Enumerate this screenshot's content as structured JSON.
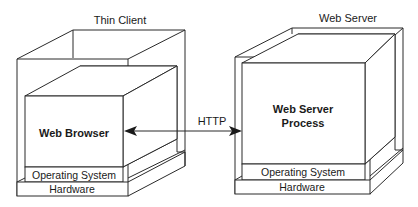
{
  "diagram": {
    "left_node": {
      "title": "Thin Client",
      "inner_label": "Web Browser",
      "os_label": "Operating System",
      "hardware_label": "Hardware"
    },
    "right_node": {
      "title": "Web Server",
      "inner_label_line1": "Web Server",
      "inner_label_line2": "Process",
      "os_label": "Operating System",
      "hardware_label": "Hardware"
    },
    "connection": {
      "label": "HTTP",
      "direction": "bidirectional"
    }
  },
  "colors": {
    "line": "#2a2a2a",
    "text": "#1a1a1a",
    "background": "#ffffff"
  }
}
